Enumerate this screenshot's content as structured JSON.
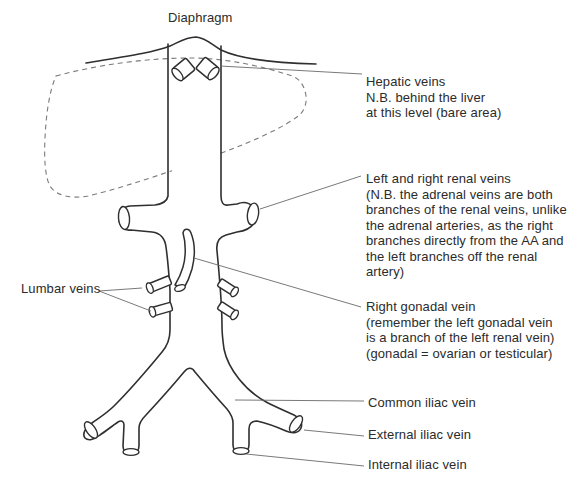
{
  "figure": {
    "background": "#ffffff"
  },
  "labels": {
    "diaphragm": "Diaphragm",
    "hepatic": "Hepatic veins\nN.B. behind the liver\nat this level (bare area)",
    "renal": "Left and right renal veins\n(N.B. the adrenal veins are both\nbranches of the renal veins, unlike\nthe adrenal arteries, as the right\nbranches directly from the AA and\nthe left branches off the renal\nartery)",
    "lumbar": "Lumbar veins",
    "gonadal": "Right gonadal vein\n(remember the left gonadal vein\nis a branch of the left renal vein)\n(gonadal = ovarian or testicular)",
    "common_iliac": "Common iliac vein",
    "external_iliac": "External iliac vein",
    "internal_iliac": "Internal iliac vein"
  },
  "colors": {
    "vessel_line": "#2f2f2f",
    "liver_dashed_line": "#7a7a7a",
    "leader_line": "#6a6a6a",
    "text": "#2b2b2b",
    "background": "#ffffff"
  }
}
